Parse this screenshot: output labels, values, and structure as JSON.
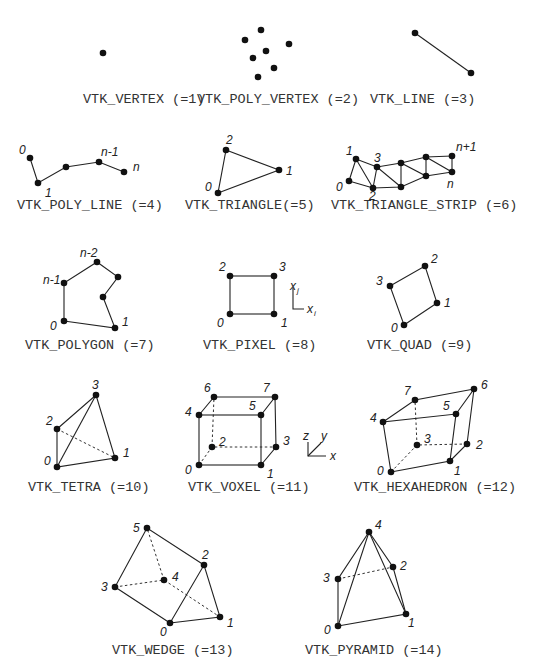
{
  "cells": [
    {
      "id": "vertex",
      "caption": "VTK_VERTEX (=1)",
      "labels": []
    },
    {
      "id": "poly-vertex",
      "caption": "VTK_POLY_VERTEX (=2)",
      "labels": []
    },
    {
      "id": "line",
      "caption": "VTK_LINE (=3)",
      "labels": []
    },
    {
      "id": "poly-line",
      "caption": "VTK_POLY_LINE (=4)",
      "labels": [
        "0",
        "1",
        "n-1",
        "n"
      ]
    },
    {
      "id": "triangle",
      "caption": "VTK_TRIANGLE(=5)",
      "labels": [
        "0",
        "1",
        "2"
      ]
    },
    {
      "id": "triangle-strip",
      "caption": "VTK_TRIANGLE_STRIP (=6)",
      "labels": [
        "0",
        "1",
        "2",
        "3",
        "n",
        "n+1"
      ]
    },
    {
      "id": "polygon",
      "caption": "VTK_POLYGON (=7)",
      "labels": [
        "0",
        "1",
        "n-2",
        "n-1"
      ]
    },
    {
      "id": "pixel",
      "caption": "VTK_PIXEL (=8)",
      "labels": [
        "0",
        "1",
        "2",
        "3"
      ],
      "axes": [
        "x",
        "j",
        "x",
        "i"
      ]
    },
    {
      "id": "quad",
      "caption": "VTK_QUAD (=9)",
      "labels": [
        "0",
        "1",
        "2",
        "3"
      ]
    },
    {
      "id": "tetra",
      "caption": "VTK_TETRA (=10)",
      "labels": [
        "0",
        "1",
        "2",
        "3"
      ]
    },
    {
      "id": "voxel",
      "caption": "VTK_VOXEL (=11)",
      "labels": [
        "0",
        "1",
        "2",
        "3",
        "4",
        "5",
        "6",
        "7"
      ],
      "axes": [
        "z",
        "y",
        "x"
      ]
    },
    {
      "id": "hexahedron",
      "caption": "VTK_HEXAHEDRON (=12)",
      "labels": [
        "0",
        "1",
        "2",
        "3",
        "4",
        "5",
        "6",
        "7"
      ]
    },
    {
      "id": "wedge",
      "caption": "VTK_WEDGE (=13)",
      "labels": [
        "0",
        "1",
        "2",
        "3",
        "4",
        "5"
      ]
    },
    {
      "id": "pyramid",
      "caption": "VTK_PYRAMID (=14)",
      "labels": [
        "0",
        "1",
        "2",
        "3",
        "4"
      ]
    }
  ]
}
